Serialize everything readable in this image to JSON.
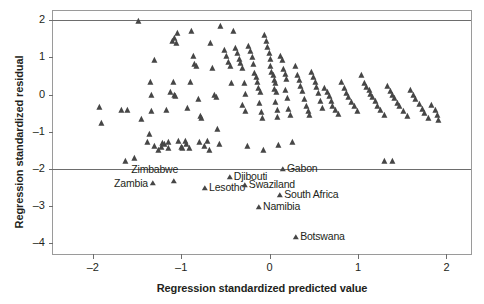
{
  "chart_data": {
    "type": "scatter",
    "title": "",
    "xlabel": "Regression standardized predicted value",
    "ylabel": "Regression standardized residual",
    "xlim": [
      -2.45,
      2.3
    ],
    "ylim": [
      -4.35,
      2.25
    ],
    "xticks": [
      -2,
      -1,
      0,
      1,
      2
    ],
    "xticklabels": [
      "–2",
      "–1",
      "0",
      "1",
      "2"
    ],
    "yticks": [
      2,
      1,
      0,
      -1,
      -2,
      -3,
      -4
    ],
    "yticklabels": [
      "2",
      "1",
      "0",
      "–1",
      "–2",
      "–3",
      "–4"
    ],
    "grid": false,
    "legend": null,
    "reference_lines": [
      {
        "orientation": "horizontal",
        "y": 2
      },
      {
        "orientation": "horizontal",
        "y": -2
      }
    ],
    "marker": "triangle",
    "marker_color": "#464646",
    "points": [
      [
        -1.48,
        1.98
      ],
      [
        -1.92,
        -0.33
      ],
      [
        -1.9,
        -0.78
      ],
      [
        -1.67,
        -0.43
      ],
      [
        -1.6,
        -0.41
      ],
      [
        -1.62,
        -1.78
      ],
      [
        -1.52,
        -1.72
      ],
      [
        -1.44,
        -0.65
      ],
      [
        -1.3,
        0.92
      ],
      [
        -1.34,
        0.35
      ],
      [
        -1.33,
        -0.02
      ],
      [
        -1.33,
        -0.44
      ],
      [
        -1.35,
        -1.05
      ],
      [
        -1.37,
        -1.28
      ],
      [
        -1.3,
        -1.38
      ],
      [
        -1.25,
        -1.49
      ],
      [
        -1.22,
        -1.41
      ],
      [
        -1.21,
        -1.3
      ],
      [
        -1.18,
        -1.34
      ],
      [
        -1.14,
        -1.45
      ],
      [
        -1.14,
        -1.29
      ],
      [
        -1.16,
        -0.41
      ],
      [
        -1.12,
        0.06
      ],
      [
        -1.08,
        0.33
      ],
      [
        -1.07,
        -0.01
      ],
      [
        -1.06,
        -0.05
      ],
      [
        -1.09,
        1.45
      ],
      [
        -1.07,
        1.52
      ],
      [
        -1.05,
        1.4
      ],
      [
        -1.04,
        1.65
      ],
      [
        -1.02,
        -1.26
      ],
      [
        -0.99,
        -1.41
      ],
      [
        -0.98,
        -1.44
      ],
      [
        -0.95,
        -1.25
      ],
      [
        -0.93,
        -1.32
      ],
      [
        -0.9,
        -1.44
      ],
      [
        -0.92,
        -0.35
      ],
      [
        -0.89,
        0.33
      ],
      [
        -0.88,
        1.7
      ],
      [
        -0.86,
        1.05
      ],
      [
        -0.84,
        0.83
      ],
      [
        -0.82,
        0.78
      ],
      [
        -0.8,
        -0.12
      ],
      [
        -0.78,
        -0.58
      ],
      [
        -0.76,
        -0.62
      ],
      [
        -0.79,
        -1.28
      ],
      [
        -0.73,
        -1.39
      ],
      [
        -0.7,
        -1.24
      ],
      [
        -0.68,
        -1.5
      ],
      [
        -0.66,
        1.4
      ],
      [
        -0.64,
        0.72
      ],
      [
        -0.62,
        -0.02
      ],
      [
        -0.6,
        -0.08
      ],
      [
        -0.58,
        -0.92
      ],
      [
        -0.56,
        -1.34
      ],
      [
        -0.55,
        1.85
      ],
      [
        -0.5,
        1.2
      ],
      [
        -0.48,
        1.05
      ],
      [
        -0.46,
        0.88
      ],
      [
        -0.44,
        0.78
      ],
      [
        -0.43,
        0.3
      ],
      [
        -0.4,
        1.7
      ],
      [
        -0.38,
        1.25
      ],
      [
        -0.36,
        1.12
      ],
      [
        -0.34,
        0.95
      ],
      [
        -0.32,
        0.85
      ],
      [
        -0.3,
        0.72
      ],
      [
        -0.28,
        0.3
      ],
      [
        -0.27,
        0.02
      ],
      [
        -0.3,
        -0.28
      ],
      [
        -0.27,
        -0.45
      ],
      [
        -0.25,
        -1.38
      ],
      [
        -0.23,
        1.32
      ],
      [
        -0.21,
        1.18
      ],
      [
        -0.19,
        1.02
      ],
      [
        -0.18,
        0.82
      ],
      [
        -0.16,
        0.58
      ],
      [
        -0.14,
        0.47
      ],
      [
        -0.13,
        0.35
      ],
      [
        -0.12,
        0.18
      ],
      [
        -0.1,
        0.06
      ],
      [
        -0.11,
        -0.22
      ],
      [
        -0.09,
        -0.47
      ],
      [
        -0.07,
        -0.62
      ],
      [
        -0.06,
        -1.5
      ],
      [
        -0.05,
        1.6
      ],
      [
        -0.03,
        1.44
      ],
      [
        -0.02,
        1.28
      ],
      [
        0.0,
        1.12
      ],
      [
        0.01,
        0.95
      ],
      [
        0.02,
        0.78
      ],
      [
        0.03,
        0.62
      ],
      [
        0.05,
        0.52
      ],
      [
        0.06,
        0.38
      ],
      [
        0.07,
        0.3
      ],
      [
        0.06,
        0.14
      ],
      [
        0.08,
        0.06
      ],
      [
        0.07,
        -0.2
      ],
      [
        0.09,
        -0.42
      ],
      [
        0.1,
        -0.6
      ],
      [
        0.11,
        -1.35
      ],
      [
        0.13,
        1.05
      ],
      [
        0.15,
        0.92
      ],
      [
        0.16,
        0.68
      ],
      [
        0.18,
        0.55
      ],
      [
        0.2,
        0.42
      ],
      [
        0.19,
        0.12
      ],
      [
        0.21,
        -0.1
      ],
      [
        0.22,
        -0.38
      ],
      [
        0.24,
        -0.55
      ],
      [
        0.26,
        -1.28
      ],
      [
        0.3,
        0.78
      ],
      [
        0.32,
        0.52
      ],
      [
        0.34,
        0.38
      ],
      [
        0.36,
        0.22
      ],
      [
        0.38,
        0.1
      ],
      [
        0.4,
        -0.12
      ],
      [
        0.42,
        -0.3
      ],
      [
        0.44,
        -0.45
      ],
      [
        0.46,
        -0.55
      ],
      [
        0.48,
        0.62
      ],
      [
        0.5,
        0.48
      ],
      [
        0.52,
        0.33
      ],
      [
        0.54,
        0.2
      ],
      [
        0.56,
        0.05
      ],
      [
        0.58,
        -0.18
      ],
      [
        0.6,
        -0.35
      ],
      [
        0.63,
        0.18
      ],
      [
        0.66,
        0.08
      ],
      [
        0.68,
        -0.05
      ],
      [
        0.7,
        -0.18
      ],
      [
        0.72,
        -0.3
      ],
      [
        0.75,
        -0.42
      ],
      [
        0.78,
        -0.52
      ],
      [
        0.82,
        0.34
      ],
      [
        0.85,
        0.18
      ],
      [
        0.88,
        0.05
      ],
      [
        0.9,
        -0.08
      ],
      [
        0.93,
        -0.2
      ],
      [
        0.96,
        -0.32
      ],
      [
        1.0,
        -0.45
      ],
      [
        1.04,
        0.52
      ],
      [
        1.08,
        0.3
      ],
      [
        1.1,
        0.2
      ],
      [
        1.13,
        0.12
      ],
      [
        1.15,
        0.02
      ],
      [
        1.17,
        -0.08
      ],
      [
        1.2,
        -0.18
      ],
      [
        1.23,
        -0.3
      ],
      [
        1.26,
        -0.42
      ],
      [
        1.3,
        -0.55
      ],
      [
        1.34,
        0.22
      ],
      [
        1.37,
        0.1
      ],
      [
        1.4,
        0.0
      ],
      [
        1.42,
        -0.1
      ],
      [
        1.45,
        -0.22
      ],
      [
        1.48,
        -0.32
      ],
      [
        1.52,
        -0.45
      ],
      [
        1.56,
        -0.58
      ],
      [
        1.6,
        0.12
      ],
      [
        1.63,
        0.0
      ],
      [
        1.66,
        -0.12
      ],
      [
        1.7,
        -0.25
      ],
      [
        1.73,
        -0.38
      ],
      [
        1.76,
        -0.5
      ],
      [
        1.8,
        -0.62
      ],
      [
        1.84,
        -0.28
      ],
      [
        1.88,
        -0.42
      ],
      [
        1.9,
        -0.55
      ],
      [
        1.92,
        -0.68
      ],
      [
        1.3,
        -1.8
      ],
      [
        1.4,
        -1.78
      ]
    ],
    "labeled_points": [
      {
        "name": "Zimbabwe",
        "x": -1.08,
        "y": -2.32,
        "label_pos": "above-left"
      },
      {
        "name": "Zambia",
        "x": -1.32,
        "y": -2.38,
        "label_pos": "left"
      },
      {
        "name": "Djibouti",
        "x": -0.45,
        "y": -2.22,
        "label_pos": "right"
      },
      {
        "name": "Lesotho",
        "x": -0.73,
        "y": -2.52,
        "label_pos": "right"
      },
      {
        "name": "Swaziland",
        "x": -0.28,
        "y": -2.45,
        "label_pos": "right"
      },
      {
        "name": "Gabon",
        "x": 0.15,
        "y": -2.0,
        "label_pos": "right"
      },
      {
        "name": "South Africa",
        "x": 0.12,
        "y": -2.72,
        "label_pos": "right"
      },
      {
        "name": "Namibia",
        "x": -0.12,
        "y": -3.02,
        "label_pos": "right"
      },
      {
        "name": "Botswana",
        "x": 0.3,
        "y": -3.85,
        "label_pos": "right"
      }
    ]
  }
}
